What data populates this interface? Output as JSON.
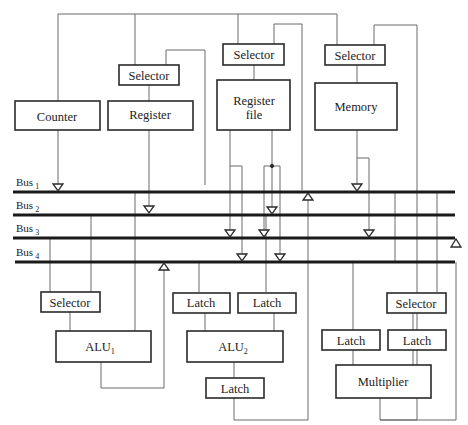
{
  "diagram": {
    "type": "datapath-block-diagram",
    "buses": [
      {
        "id": "bus1",
        "label": "Bus",
        "subscript": "1"
      },
      {
        "id": "bus2",
        "label": "Bus",
        "subscript": "2"
      },
      {
        "id": "bus3",
        "label": "Bus",
        "subscript": "3"
      },
      {
        "id": "bus4",
        "label": "Bus",
        "subscript": "4"
      }
    ],
    "blocks": {
      "counter": "Counter",
      "register_selector": "Selector",
      "register": "Register",
      "regfile_selector": "Selector",
      "regfile_line1": "Register",
      "regfile_line2": "file",
      "memory_selector": "Selector",
      "memory": "Memory",
      "alu1_selector": "Selector",
      "alu1": "ALU",
      "alu1_sub": "1",
      "alu2_latch_a": "Latch",
      "alu2_latch_b": "Latch",
      "alu2": "ALU",
      "alu2_sub": "2",
      "alu2_out_latch": "Latch",
      "mult_selector": "Selector",
      "mult_latch_a": "Latch",
      "mult_latch_b": "Latch",
      "multiplier": "Multiplier"
    }
  }
}
